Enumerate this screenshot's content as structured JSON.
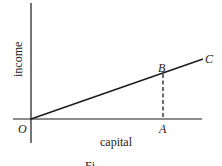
{
  "diagram": {
    "axes": {
      "x_label": "capital",
      "y_label": "income",
      "origin_label": "O"
    },
    "points": {
      "a_label": "A",
      "b_label": "B",
      "c_label": "C"
    },
    "caption": "Fi",
    "colors": {
      "line": "#1a1a1a",
      "text": "#222222"
    }
  }
}
